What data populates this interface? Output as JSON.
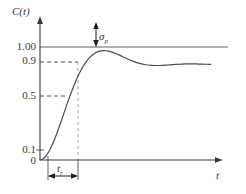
{
  "chart_data": {
    "type": "line",
    "title": "",
    "xlabel": "t",
    "ylabel": "C(t)",
    "grid": false,
    "legend": null,
    "xlim": [
      0,
      10.5
    ],
    "ylim": [
      0,
      1.45
    ],
    "yticks": [
      {
        "value": 0,
        "label": "0"
      },
      {
        "value": 0.1,
        "label": "0.1"
      },
      {
        "value": 0.5,
        "label": "0.5"
      },
      {
        "value": 0.9,
        "label": "0.9"
      },
      {
        "value": 1.0,
        "label": "1.00"
      }
    ],
    "xticks": [
      {
        "value": 0.55,
        "label": ""
      },
      {
        "value": 2.35,
        "label": ""
      }
    ],
    "reference_lines": [
      {
        "name": "steady-state",
        "value": 1.0,
        "style": "solid",
        "orientation": "horizontal"
      },
      {
        "name": "ninety-percent",
        "value": 0.9,
        "style": "dashed",
        "orientation": "horizontal"
      },
      {
        "name": "fifty-percent",
        "value": 0.5,
        "style": "dashed",
        "orientation": "horizontal"
      },
      {
        "name": "rise-time-drop",
        "value": 2.35,
        "style": "dashed",
        "orientation": "vertical"
      }
    ],
    "annotations": [
      {
        "name": "overshoot",
        "label": "σ",
        "sub": "p",
        "at_x": 3.3,
        "from_y": 1.0,
        "to_y": 1.33
      },
      {
        "name": "rise-time",
        "label": "t",
        "sub": "r",
        "from_x": 0.55,
        "to_x": 2.35
      }
    ],
    "series": [
      {
        "name": "step-response",
        "x": [
          0.0,
          0.2,
          0.4,
          0.6,
          0.8,
          1.0,
          1.2,
          1.4,
          1.6,
          1.8,
          2.0,
          2.2,
          2.4,
          2.6,
          2.8,
          3.0,
          3.2,
          3.4,
          3.6,
          3.8,
          4.0,
          4.2,
          4.4,
          4.6,
          4.8,
          5.0,
          5.2,
          5.4,
          5.6,
          5.8,
          6.0,
          6.2,
          6.4,
          6.6,
          6.8,
          7.0,
          7.2,
          7.4,
          7.6,
          7.8,
          8.0,
          8.2,
          8.4,
          8.6,
          8.8,
          9.0,
          9.2,
          9.4,
          9.6,
          9.8,
          10.0,
          10.3
        ],
        "y": [
          0.0,
          0.013,
          0.05,
          0.108,
          0.183,
          0.271,
          0.368,
          0.469,
          0.571,
          0.669,
          0.762,
          0.846,
          0.92,
          0.984,
          1.036,
          1.078,
          1.109,
          1.131,
          1.144,
          1.149,
          1.148,
          1.141,
          1.131,
          1.117,
          1.102,
          1.085,
          1.069,
          1.053,
          1.039,
          1.026,
          1.016,
          1.007,
          1.001,
          0.997,
          0.994,
          0.993,
          0.993,
          0.995,
          0.997,
          0.999,
          1.002,
          1.004,
          1.006,
          1.008,
          1.009,
          1.009,
          1.009,
          1.009,
          1.008,
          1.007,
          1.006,
          1.004
        ]
      }
    ]
  },
  "labels": {
    "y_axis": "C(t)",
    "y_axis_main": "C",
    "y_axis_arg": "(t)",
    "x_axis": "t",
    "tick_100": "1.00",
    "tick_09": "0.9",
    "tick_05": "0.5",
    "tick_01": "0.1",
    "tick_0": "0",
    "overshoot_symbol": "σ",
    "overshoot_sub": "p",
    "risetime_symbol": "t",
    "risetime_sub": "r"
  },
  "colors": {
    "curve": "#4a4a4a",
    "axis": "#3a3a3a",
    "dashed": "#3a3a3a",
    "text": "#3a3a3a",
    "background": "#ffffff"
  }
}
